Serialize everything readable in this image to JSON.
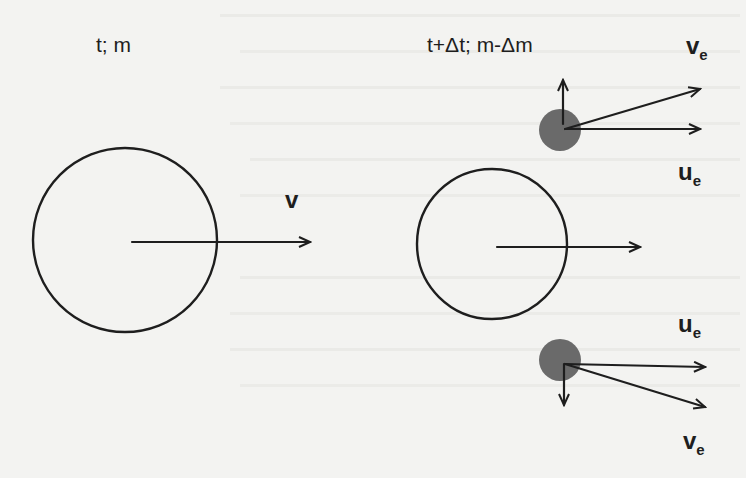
{
  "diagram": {
    "left_state": {
      "label": "t; m",
      "velocity_label": "v"
    },
    "right_state": {
      "label": "t+Δt; m-Δm",
      "top_particle": {
        "velocity_label": "v",
        "velocity_sub": "e",
        "relative_label": "u",
        "relative_sub": "e"
      },
      "bottom_particle": {
        "relative_label": "u",
        "relative_sub": "e",
        "velocity_label": "v",
        "velocity_sub": "e"
      }
    },
    "colors": {
      "ink": "#1e1e1e",
      "particle_fill": "#6a6a6a",
      "paper": "#f3f3f1"
    }
  }
}
